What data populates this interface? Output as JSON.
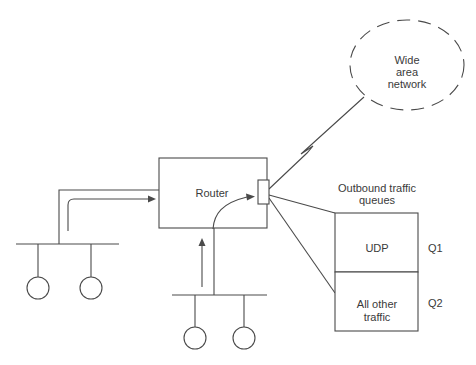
{
  "colors": {
    "line": "#4a4a4a",
    "text": "#3a3a3a",
    "background": "#ffffff"
  },
  "diagram": {
    "wan": {
      "label_lines": [
        "Wide",
        "area",
        "network"
      ]
    },
    "router": {
      "label": "Router"
    },
    "queues": {
      "title_lines": [
        "Outbound traffic",
        "queues"
      ],
      "items": [
        {
          "label_lines": [
            "UDP",
            ""
          ],
          "tag": "Q1"
        },
        {
          "label_lines": [
            "All other",
            "traffic"
          ],
          "tag": "Q2"
        }
      ]
    }
  }
}
